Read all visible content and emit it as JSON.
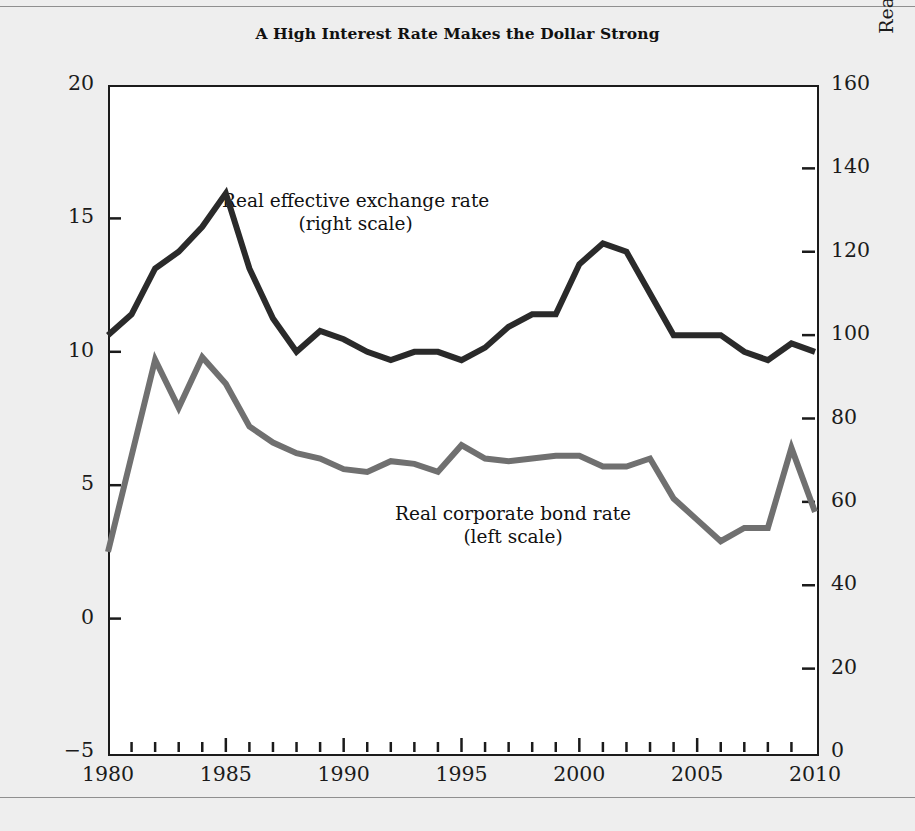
{
  "title": "A High Interest Rate Makes the Dollar Strong",
  "axes": {
    "left_title": "Real corporate bond rate (percent)",
    "right_title": "Real exchange rate (1980 = 100)",
    "left_ticks": [
      "20",
      "15",
      "10",
      "5",
      "0",
      "−5"
    ],
    "right_ticks": [
      "160",
      "140",
      "120",
      "100",
      "80",
      "60",
      "40",
      "20",
      "0"
    ],
    "x_ticks": [
      "1980",
      "1985",
      "1990",
      "1995",
      "2000",
      "2005",
      "2010"
    ]
  },
  "annotations": {
    "exchange_line1": "Real effective exchange rate",
    "exchange_line2": "(right scale)",
    "bond_line1": "Real corporate bond rate",
    "bond_line2": "(left scale)"
  },
  "colors": {
    "exchange_line": "#2a2a2a",
    "bond_line": "#707070",
    "frame": "#1b1b1b",
    "plot_background": "#ffffff",
    "page_background": "#eeeeee"
  },
  "chart_data": {
    "type": "line",
    "title": "A High Interest Rate Makes the Dollar Strong",
    "xlabel": "",
    "ylabel": "Real corporate bond rate (percent)",
    "y2label": "Real exchange rate (1980 = 100)",
    "xlim": [
      1980,
      2010
    ],
    "ylim": [
      -5,
      20
    ],
    "y2lim": [
      0,
      160
    ],
    "grid": false,
    "legend": "inline annotations",
    "x": [
      1980,
      1981,
      1982,
      1983,
      1984,
      1985,
      1986,
      1987,
      1988,
      1989,
      1990,
      1991,
      1992,
      1993,
      1994,
      1995,
      1996,
      1997,
      1998,
      1999,
      2000,
      2001,
      2002,
      2003,
      2004,
      2005,
      2006,
      2007,
      2008,
      2009,
      2010
    ],
    "series": [
      {
        "name": "Real effective exchange rate (right scale)",
        "axis": "right",
        "units": "1980 = 100",
        "color": "#2a2a2a",
        "values": [
          100,
          105,
          116,
          120,
          126,
          134,
          116,
          104,
          96,
          101,
          99,
          96,
          94,
          96,
          96,
          94,
          97,
          102,
          105,
          105,
          117,
          122,
          120,
          110,
          100,
          100,
          100,
          96,
          94,
          98,
          96
        ]
      },
      {
        "name": "Real corporate bond rate (left scale)",
        "axis": "left",
        "units": "percent",
        "color": "#707070",
        "values": [
          2.5,
          6.1,
          9.7,
          7.9,
          9.8,
          8.8,
          7.2,
          6.6,
          6.2,
          6.0,
          5.6,
          5.5,
          5.9,
          5.8,
          5.5,
          6.5,
          6.0,
          5.9,
          6.0,
          6.1,
          6.1,
          5.7,
          5.7,
          6.0,
          4.5,
          3.7,
          2.9,
          3.4,
          3.4,
          6.4,
          4.0
        ]
      }
    ]
  }
}
